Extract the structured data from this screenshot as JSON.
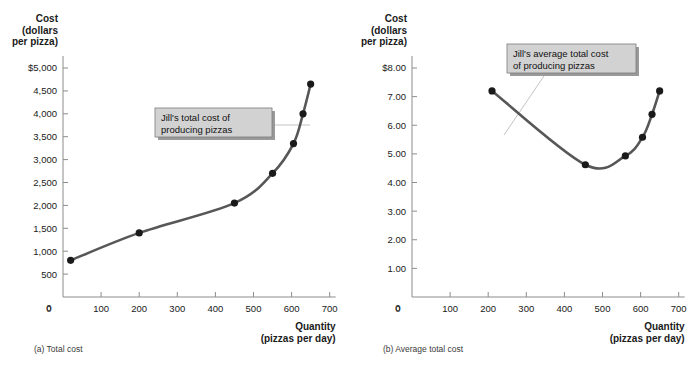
{
  "figure": {
    "background": "#ffffff",
    "curve_color": "#575757",
    "point_color": "#1a1a1a",
    "axis_color": "#8c8c8c",
    "callout_fill": "#d2d2d2"
  },
  "panels": [
    {
      "id": "total-cost",
      "caption": "(a) Total cost",
      "y_axis_title_lines": [
        "Cost",
        "(dollars",
        "per pizza)"
      ],
      "x_axis_title_lines": [
        "Quantity",
        "(pizzas per day)"
      ],
      "y_ticks": [
        "$5,000",
        "4,500",
        "4,000",
        "3,500",
        "3,000",
        "2,500",
        "2,000",
        "1,500",
        "1,000",
        "500",
        "0"
      ],
      "x_ticks": [
        "0",
        "100",
        "200",
        "300",
        "400",
        "500",
        "600",
        "700"
      ],
      "callout": {
        "lines": [
          "Jill's total cost of",
          "producing pizzas"
        ]
      },
      "chart_data": {
        "type": "line",
        "title": "Total cost",
        "xlabel": "Quantity (pizzas per day)",
        "ylabel": "Cost (dollars per pizza)",
        "xlim": [
          0,
          700
        ],
        "ylim": [
          0,
          5000
        ],
        "grid": false,
        "legend": "none",
        "series": [
          {
            "name": "Jill's total cost of producing pizzas",
            "x": [
              20,
              200,
              450,
              550,
              605,
              630,
              650
            ],
            "y": [
              800,
              1400,
              2050,
              2700,
              3350,
              4000,
              4650
            ]
          }
        ]
      }
    },
    {
      "id": "average-total-cost",
      "caption": "(b) Average total cost",
      "y_axis_title_lines": [
        "Cost",
        "(dollars",
        "per pizza)"
      ],
      "x_axis_title_lines": [
        "Quantity",
        "(pizzas per day)"
      ],
      "y_ticks": [
        "$8.00",
        "7.00",
        "6.00",
        "5.00",
        "4.00",
        "3.00",
        "2.00",
        "1.00",
        "0"
      ],
      "x_ticks": [
        "0",
        "100",
        "200",
        "300",
        "400",
        "500",
        "600",
        "700"
      ],
      "callout": {
        "lines": [
          "Jill's average total cost",
          "of producing pizzas"
        ]
      },
      "chart_data": {
        "type": "line",
        "title": "Average total cost",
        "xlabel": "Quantity (pizzas per day)",
        "ylabel": "Cost (dollars per pizza)",
        "xlim": [
          0,
          700
        ],
        "ylim": [
          0,
          8
        ],
        "grid": false,
        "legend": "none",
        "series": [
          {
            "name": "Jill's average total cost of producing pizzas",
            "x": [
              210,
              455,
              560,
              605,
              630,
              650
            ],
            "y": [
              7.2,
              4.62,
              4.93,
              5.58,
              6.38,
              7.2
            ]
          }
        ]
      }
    }
  ]
}
